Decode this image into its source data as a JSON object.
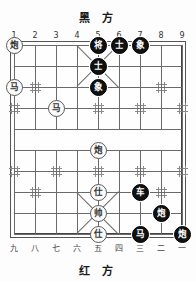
{
  "board": {
    "title_top": "黑 方",
    "title_bottom": "红 方",
    "top_coords": [
      "1",
      "2",
      "3",
      "4",
      "5",
      "6",
      "7",
      "8",
      "9"
    ],
    "bottom_coords": [
      "九",
      "八",
      "七",
      "六",
      "五",
      "四",
      "三",
      "二",
      "一"
    ],
    "columns": 9,
    "rows": 10,
    "colors": {
      "black_piece_fill": "#111111",
      "black_piece_text": "#ffffff",
      "red_piece_fill": "#fcfcfc",
      "red_piece_text": "#333333",
      "grid_line": "#6a6a6a",
      "border": "#444444",
      "background": "#fdfdfd"
    },
    "pieces": [
      {
        "name": "red-cannon-1",
        "label": "炮",
        "side": "red",
        "col": 1,
        "row": 0
      },
      {
        "name": "black-general",
        "label": "将",
        "side": "black",
        "col": 5,
        "row": 0
      },
      {
        "name": "black-advisor-1",
        "label": "士",
        "side": "black",
        "col": 6,
        "row": 0
      },
      {
        "name": "black-elephant-1",
        "label": "象",
        "side": "black",
        "col": 7,
        "row": 0
      },
      {
        "name": "black-advisor-2",
        "label": "士",
        "side": "black",
        "col": 5,
        "row": 1
      },
      {
        "name": "red-horse-1",
        "label": "马",
        "side": "red",
        "col": 1,
        "row": 2
      },
      {
        "name": "black-elephant-2",
        "label": "象",
        "side": "black",
        "col": 5,
        "row": 2
      },
      {
        "name": "red-horse-2",
        "label": "马",
        "side": "red",
        "col": 3,
        "row": 3
      },
      {
        "name": "red-cannon-2",
        "label": "炮",
        "side": "red",
        "col": 5,
        "row": 5
      },
      {
        "name": "red-advisor-1",
        "label": "仕",
        "side": "red",
        "col": 5,
        "row": 7
      },
      {
        "name": "black-chariot",
        "label": "车",
        "side": "black",
        "col": 7,
        "row": 7
      },
      {
        "name": "red-general",
        "label": "帅",
        "side": "red",
        "col": 5,
        "row": 8
      },
      {
        "name": "black-cannon-1",
        "label": "炮",
        "side": "black",
        "col": 8,
        "row": 8
      },
      {
        "name": "red-advisor-2",
        "label": "仕",
        "side": "red",
        "col": 5,
        "row": 9
      },
      {
        "name": "black-horse",
        "label": "马",
        "side": "black",
        "col": 7,
        "row": 9
      },
      {
        "name": "black-cannon-2",
        "label": "炮",
        "side": "black",
        "col": 9,
        "row": 9
      }
    ],
    "star_points": [
      {
        "col": 2,
        "row": 2
      },
      {
        "col": 8,
        "row": 2
      },
      {
        "col": 1,
        "row": 3
      },
      {
        "col": 3,
        "row": 3
      },
      {
        "col": 5,
        "row": 3
      },
      {
        "col": 7,
        "row": 3
      },
      {
        "col": 9,
        "row": 3
      },
      {
        "col": 1,
        "row": 6
      },
      {
        "col": 3,
        "row": 6
      },
      {
        "col": 5,
        "row": 6
      },
      {
        "col": 7,
        "row": 6
      },
      {
        "col": 9,
        "row": 6
      },
      {
        "col": 2,
        "row": 7
      },
      {
        "col": 8,
        "row": 7
      }
    ]
  }
}
